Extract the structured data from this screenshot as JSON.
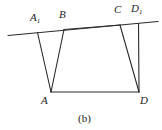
{
  "figure": {
    "caption": "(b)",
    "caption_pos": {
      "x": 78,
      "y": 113
    },
    "background_color": "#ffffff",
    "stroke_color": "#2b2b2b",
    "stroke_width": 1.1,
    "width": 162,
    "height": 130,
    "points": {
      "A1": {
        "x": 37.5,
        "y": 32.5
      },
      "B": {
        "x": 64.0,
        "y": 29.5
      },
      "C": {
        "x": 120.0,
        "y": 25.0
      },
      "D1": {
        "x": 138.5,
        "y": 23.5
      },
      "A": {
        "x": 51.0,
        "y": 92.0
      },
      "D": {
        "x": 139.0,
        "y": 92.0
      },
      "L": {
        "x": 8.0,
        "y": 35.5
      },
      "R": {
        "x": 158.0,
        "y": 21.5
      }
    },
    "segments": [
      {
        "name": "transversal-line",
        "from": "L",
        "to": "R"
      },
      {
        "name": "segment-A1-A",
        "from": "A1",
        "to": "A"
      },
      {
        "name": "segment-B-A",
        "from": "B",
        "to": "A"
      },
      {
        "name": "segment-B-C",
        "from": "B",
        "to": "C"
      },
      {
        "name": "segment-C-D",
        "from": "C",
        "to": "D"
      },
      {
        "name": "segment-D1-D",
        "from": "D1",
        "to": "D"
      },
      {
        "name": "segment-A-D",
        "from": "A",
        "to": "D"
      }
    ],
    "labels": [
      {
        "key": "A1",
        "text": "A",
        "sub": "1",
        "x": 30,
        "y": 12
      },
      {
        "key": "B",
        "text": "B",
        "sub": "",
        "x": 59,
        "y": 9
      },
      {
        "key": "C",
        "text": "C",
        "sub": "",
        "x": 114,
        "y": 4
      },
      {
        "key": "D1",
        "text": "D",
        "sub": "1",
        "x": 131,
        "y": 3
      },
      {
        "key": "A",
        "text": "A",
        "sub": "",
        "x": 41,
        "y": 95
      },
      {
        "key": "D",
        "text": "D",
        "sub": "",
        "x": 140,
        "y": 95
      }
    ]
  }
}
